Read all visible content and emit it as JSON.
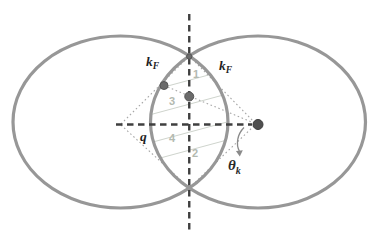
{
  "diagram": {
    "labels": {
      "kf_left": {
        "main": "k",
        "sub": "F"
      },
      "kf_right": {
        "main": "k",
        "sub": "F"
      },
      "q": "q",
      "theta_k": {
        "main": "θ",
        "sub": "k"
      }
    },
    "region_labels": {
      "r1": "1",
      "r2": "2",
      "r3": "3",
      "r4": "4"
    },
    "colors": {
      "circle_stroke": "#979797",
      "axis_dash": "#3f3f3f",
      "kite_dotted": "#a7a7a7",
      "hatch_line": "#cfd4cd",
      "region_label": "#b3b9b0",
      "dot_fill": "#6b6b6b",
      "dot_dark_fill": "#4f4f4f",
      "label_text": "#1f1f1f",
      "arrow": "#8a8a8a"
    }
  }
}
